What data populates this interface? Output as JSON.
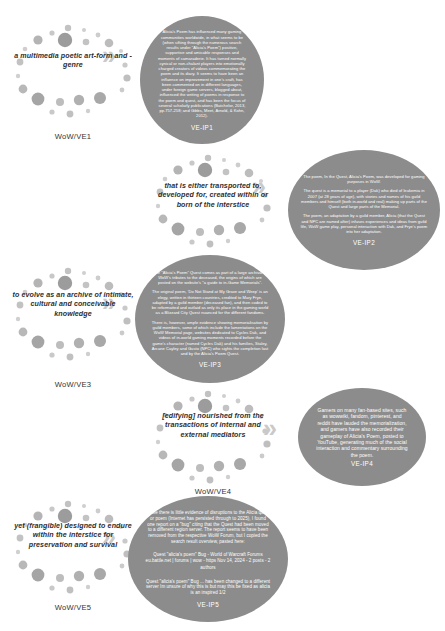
{
  "diagram": {
    "type": "five-stage virtual-ethnography flow diagram",
    "rows": [
      {
        "id": "row1",
        "cluster": {
          "label": "a multimedia poetic art-form and -genre",
          "code": "WoW/VE1"
        },
        "arrow": "»",
        "blob": {
          "code": "VE-IP1",
          "paragraphs": [
            "Alicia's Poem has influenced many gaming communities worldwide, in what seems to be (when sifting through the numerous search results under \"Alicia's Poem\") positive, supportive and amicable responses and moments of camaraderie. It has turned normally cynical  or non-chalant players into emotionally charged creators of videos commemorating the poem and its diary. It seems to have been an influence on improvement in one's craft, has been commented on in different languages, under foreign game servers, blogged about, influenced the writing of poems in response to the poem and quest, and has been the focus of several scholarly publications (Batchelor, 2013, pp.757-258; and Gibbs, Meet, Arnold, & Kohn, 2012)."
          ]
        }
      },
      {
        "id": "row2",
        "cluster": {
          "label": "that is either transported to, developed for, created within or born of the interstice",
          "code": "WoW/VE2"
        },
        "arrow": "»",
        "blob": {
          "code": "VE-IP2",
          "paragraphs": [
            "The poem, In the Quest, Alicia's Poem, was developed for gaming purposes in WoW.",
            "The quest is a memorial to a player (Dak) who died of leukemia in 2007 (at 28 years of age), with stories and names of his guild members and himself (both in-world and real) making up parts of the Quest and large parts of the Memorial.",
            "The poem, an adaptation by a guild member, Alicia (that the Quest and NPC are named after) infuses experiences and ideas from guild life, WoW game play, personal interaction with Dak, and Frye's poem into her adaptation."
          ]
        }
      },
      {
        "id": "row3",
        "cluster": {
          "label": "to evolve as an archive of intimate, cultural and conceivable knowledge",
          "code": "WoW/VE3"
        },
        "arrow": "»",
        "blob": {
          "code": "VE-IP3",
          "paragraphs": [
            "The \"Alicia's Poem\" Quest comes as part of a large archival of WoW's tributes to the deceased, the origins of which are posted on the website's \"a guide to in-Game Memorials\".",
            "The original poem, 'Do Not Stand at My Grave and Weep' is an elegy, written in thirteen countries, credited to Mary Frye, adapted by a guild member (deceased fan), and then coded to be reformatted and outlaid as only its place in the gaming world as a Blizzard City Quest nuanced for the different fandoms.",
            "There is, however, ample evidence showing memorialisation by guild members, some of which include the lamentations on the WoW Memorial page, websites dedicated to Cycles Dak, and videos of in-world gaming moments recorded before the game's character (named Cycles Dak) and his families, Staley, Arcane Cayley and Gusto (NPC) who sights the completion last and by the Alicia's Poem Quest."
          ]
        }
      },
      {
        "id": "row4",
        "cluster": {
          "label": "[edifying] nourished from the transactions of internal and external mediators",
          "code": "WoW/VE4"
        },
        "arrow": "»",
        "blob": {
          "code": "VE-IP4",
          "paragraphs": [
            "Gamers on many fan-based sites, such as wowwiki, fandom, pinterest, and reddit have lauded the memorialization, and gamers have also recorded their gameplay of Alicia's Poem, posted to YouTube, generating much of the social interaction and commentary surrounding the poem."
          ]
        }
      },
      {
        "id": "row5",
        "cluster": {
          "label": "yet (frangible) designed to endure within the interstice for preservation and survival",
          "code": "WoW/VE5"
        },
        "arrow": "»",
        "blob": {
          "code": "VE-IP5",
          "paragraphs": [
            "While there is little evidence of disruptions to the Alicia quest or poem (Internet has persisted through to 2025), I found one report on a \"bug\" citing that the Quest had been moved to a different region server. The report seems to have been removed from the respective WoW Forum, but I copied the search result overview, pasted here:",
            "Quest \"alicia's poem\" Bug - World of Warcraft Forums eu.battle.net | forums | wow - https Nov 14, 2024 - 2 posts - 2 authors",
            "Quest \"alicia's poem\" Bug ... has been changed to a different server Im unsure of why this is but may this be fixed as alicia is an inspired 1/2"
          ]
        }
      }
    ],
    "colors": {
      "blob_fill": "#8c8c8c",
      "blob_text": "#ffffff",
      "cluster_dot_dark": "#8f8f8f",
      "cluster_dot_light": "#bdbdbd",
      "arrow": "#c9c9c9",
      "label_text": "#2e2e2e",
      "background": "#ffffff"
    }
  }
}
